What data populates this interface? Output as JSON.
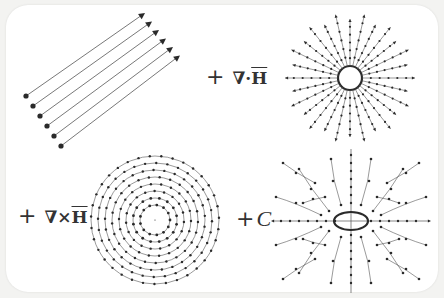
{
  "diagram": {
    "colors": {
      "background": "#f3f3f1",
      "panel": "#ffffff",
      "stroke": "#555555",
      "dot": "#2a2a2a"
    },
    "terms": [
      {
        "id": "uniform",
        "operator": "",
        "label": "",
        "description": "uniform (constant) field, parallel arrows"
      },
      {
        "id": "divergence",
        "operator": "+",
        "label": "∇·H̄",
        "symbol_parts": [
          "∇",
          "·",
          "H"
        ],
        "description": "radial source field"
      },
      {
        "id": "curl",
        "operator": "+",
        "label": "∇×H̄",
        "symbol_parts": [
          "∇",
          "×",
          "H"
        ],
        "description": "rotational (vortex) field"
      },
      {
        "id": "harmonic",
        "operator": "+",
        "label": "C",
        "symbol_parts": [
          "C"
        ],
        "description": "saddle / harmonic field"
      }
    ]
  }
}
